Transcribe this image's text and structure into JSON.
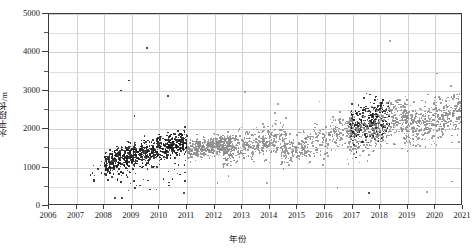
{
  "chart_data": {
    "type": "scatter",
    "title": "",
    "xlabel": "年份",
    "ylabel": "水平段长/m",
    "xlim": [
      2006,
      2021
    ],
    "ylim": [
      0,
      5000
    ],
    "grid": true,
    "legend": "none",
    "x_ticks": [
      "2006",
      "2007",
      "2008",
      "2009",
      "2010",
      "2011",
      "2012",
      "2013",
      "2014",
      "2015",
      "2016",
      "2017",
      "2018",
      "2019",
      "2020",
      "2021"
    ],
    "y_ticks": [
      "0",
      "1000",
      "2000",
      "3000",
      "4000",
      "5000"
    ],
    "y_minor_step": 500,
    "series": [
      {
        "name": "dark-points",
        "color": "#1c1c1c",
        "n_points": 1150,
        "description": "Dense dark cluster spanning 2008-2011 near 1200-1600 m, plus a second dark dense cluster at 2017-2018 near 1500-3000 m",
        "clusters": [
          {
            "x_range": [
              2008.0,
              2011.0
            ],
            "y_center": 1400,
            "y_spread": 260,
            "n": 760,
            "trend_slope": 90
          },
          {
            "x_range": [
              2016.9,
              2018.35
            ],
            "y_center": 2200,
            "y_spread": 430,
            "n": 320,
            "trend_slope": 140
          },
          {
            "x_range": [
              2007.4,
              2011.0
            ],
            "y_center": 900,
            "y_spread": 330,
            "n": 70,
            "trend_slope": 0
          }
        ],
        "outliers": [
          {
            "x": 2009.55,
            "y": 4120
          },
          {
            "x": 2008.9,
            "y": 3270
          },
          {
            "x": 2008.6,
            "y": 3010
          },
          {
            "x": 2010.3,
            "y": 2860
          },
          {
            "x": 2009.1,
            "y": 2350
          },
          {
            "x": 2009.9,
            "y": 430
          },
          {
            "x": 2010.35,
            "y": 530
          },
          {
            "x": 2008.4,
            "y": 200
          },
          {
            "x": 2008.65,
            "y": 215
          },
          {
            "x": 2010.9,
            "y": 330
          },
          {
            "x": 2017.6,
            "y": 330
          }
        ]
      },
      {
        "name": "gray-points",
        "color": "#8c8c8c",
        "n_points": 2050,
        "description": "Broad gray scatter from 2011 to 2021, median rising from ~1500 m to ~2300 m with increasing vertical spread",
        "clusters": [
          {
            "x_range": [
              2011.0,
              2012.6
            ],
            "y_center": 1550,
            "y_spread": 230,
            "n": 430,
            "trend_slope": 60
          },
          {
            "x_range": [
              2012.3,
              2014.6
            ],
            "y_center": 1620,
            "y_spread": 330,
            "n": 420,
            "trend_slope": 90
          },
          {
            "x_range": [
              2014.4,
              2017.0
            ],
            "y_center": 1700,
            "y_spread": 380,
            "n": 330,
            "trend_slope": 140
          },
          {
            "x_range": [
              2016.8,
              2019.0
            ],
            "y_center": 2050,
            "y_spread": 470,
            "n": 430,
            "trend_slope": 160
          },
          {
            "x_range": [
              2018.9,
              2021.0
            ],
            "y_center": 2250,
            "y_spread": 480,
            "n": 440,
            "trend_slope": 120
          }
        ],
        "outliers": [
          {
            "x": 2018.35,
            "y": 4290
          },
          {
            "x": 2020.05,
            "y": 3450
          },
          {
            "x": 2013.1,
            "y": 2960
          },
          {
            "x": 2014.3,
            "y": 2660
          },
          {
            "x": 2015.8,
            "y": 2720
          },
          {
            "x": 2012.5,
            "y": 780
          },
          {
            "x": 2013.9,
            "y": 600
          },
          {
            "x": 2016.45,
            "y": 470
          },
          {
            "x": 2019.7,
            "y": 360
          },
          {
            "x": 2020.6,
            "y": 640
          },
          {
            "x": 2012.1,
            "y": 600
          }
        ]
      }
    ]
  },
  "axes": {
    "y_title": "水平段长/m",
    "x_title": "年份"
  }
}
